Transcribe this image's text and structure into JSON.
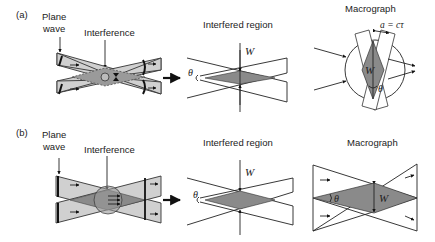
{
  "figure": {
    "panel_a": {
      "label": "(a)",
      "plane_wave_line1": "Plane",
      "plane_wave_line2": "wave",
      "interference": "Interference",
      "interfered_region": "Interfered region",
      "macrograph": "Macrograph",
      "symbol_w": "W",
      "symbol_theta": "θ",
      "equation": "a = cτ"
    },
    "panel_b": {
      "label": "(b)",
      "plane_wave_line1": "Plane",
      "plane_wave_line2": "wave",
      "interference": "Interference",
      "interfered_region": "Interfered region",
      "macrograph": "Macrograph",
      "symbol_w": "W",
      "symbol_theta": "θ"
    },
    "colors": {
      "beam_fill": "#d0d0d0",
      "overlap_fill": "#888888",
      "line": "#222222"
    }
  }
}
